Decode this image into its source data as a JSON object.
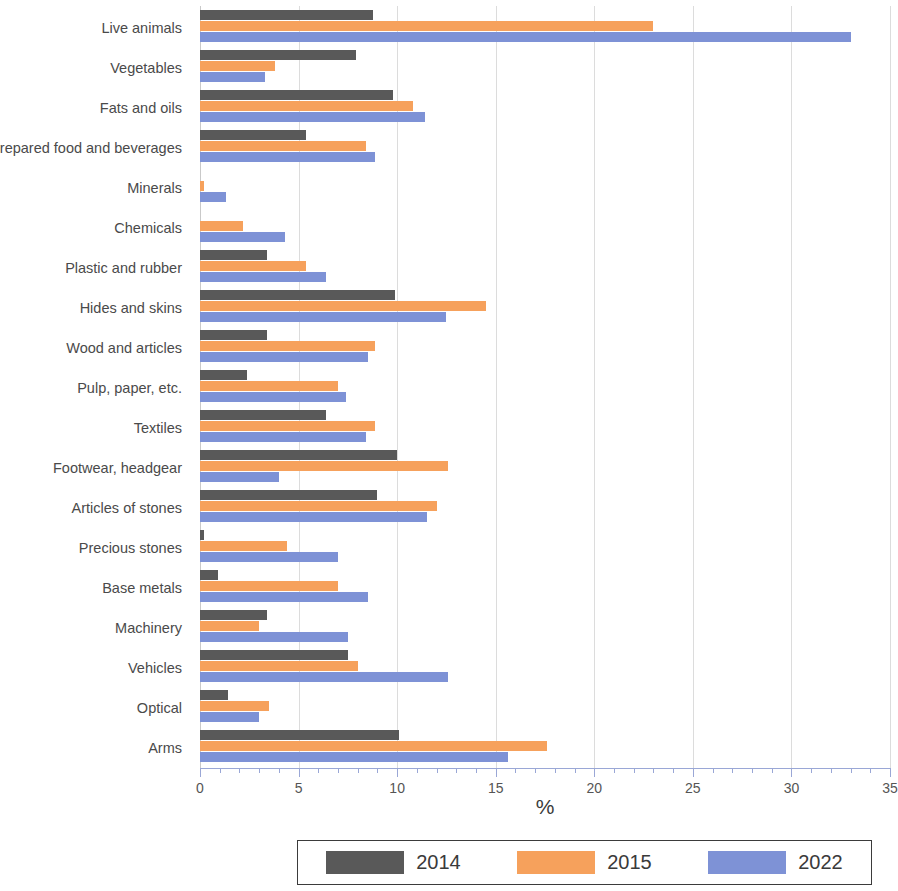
{
  "chart_data": {
    "type": "bar",
    "orientation": "horizontal",
    "title": "",
    "xlabel": "%",
    "ylabel": "",
    "xlim": [
      0,
      35
    ],
    "xticks": [
      0,
      5,
      10,
      15,
      20,
      25,
      30,
      35
    ],
    "xtick_labels": [
      "0",
      "5",
      "10",
      "15",
      "20",
      "25",
      "30",
      "35"
    ],
    "minor_tick_step": 1,
    "grid": true,
    "grid_axis": "x",
    "legend_position": "bottom",
    "categories": [
      "Live animals",
      "Vegetables",
      "Fats and oils",
      "Prepared food and beverages",
      "Minerals",
      "Chemicals",
      "Plastic and rubber",
      "Hides and skins",
      "Wood and articles",
      "Pulp, paper, etc.",
      "Textiles",
      "Footwear, headgear",
      "Articles of stones",
      "Precious stones",
      "Base metals",
      "Machinery",
      "Vehicles",
      "Optical",
      "Arms"
    ],
    "series": [
      {
        "name": "2014",
        "color": "#595959",
        "values": [
          8.8,
          7.9,
          9.8,
          5.4,
          0.0,
          0.0,
          3.4,
          9.9,
          3.4,
          2.4,
          6.4,
          10.0,
          9.0,
          0.2,
          0.9,
          3.4,
          7.5,
          1.4,
          10.1
        ]
      },
      {
        "name": "2015",
        "color": "#f6a15c",
        "values": [
          23.0,
          3.8,
          10.8,
          8.4,
          0.2,
          2.2,
          5.4,
          14.5,
          8.9,
          7.0,
          8.9,
          12.6,
          12.0,
          4.4,
          7.0,
          3.0,
          8.0,
          3.5,
          17.6
        ]
      },
      {
        "name": "2022",
        "color": "#7e92d6",
        "values": [
          33.0,
          3.3,
          11.4,
          8.9,
          1.3,
          4.3,
          6.4,
          12.5,
          8.5,
          7.4,
          8.4,
          4.0,
          11.5,
          7.0,
          8.5,
          7.5,
          12.6,
          3.0,
          15.6
        ]
      }
    ]
  },
  "legend": {
    "entries": [
      {
        "label": "2014",
        "color": "#595959"
      },
      {
        "label": "2015",
        "color": "#f6a15c"
      },
      {
        "label": "2022",
        "color": "#7e92d6"
      }
    ]
  }
}
